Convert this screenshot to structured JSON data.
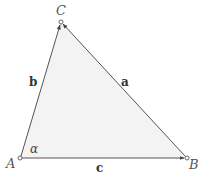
{
  "diagram": {
    "title": "",
    "fill_color": "#f3f3f3",
    "stroke_color": "#555555",
    "vertices": [
      {
        "id": "A",
        "label": "A",
        "x": 20,
        "y": 158
      },
      {
        "id": "B",
        "label": "B",
        "x": 187,
        "y": 158
      },
      {
        "id": "C",
        "label": "C",
        "x": 61,
        "y": 22
      }
    ],
    "sides": [
      {
        "id": "a",
        "label": "a",
        "from": "B",
        "to": "C"
      },
      {
        "id": "b",
        "label": "b",
        "from": "A",
        "to": "C"
      },
      {
        "id": "c",
        "label": "c",
        "from": "A",
        "to": "B"
      }
    ],
    "angles": [
      {
        "vertex": "A",
        "label": "α"
      }
    ]
  }
}
